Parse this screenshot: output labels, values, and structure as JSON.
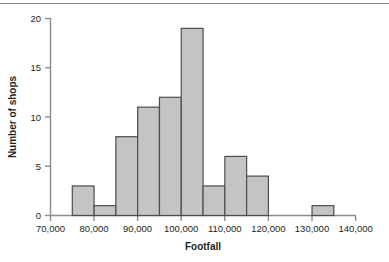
{
  "chart_data": {
    "type": "bar",
    "title": "",
    "subtitle": "",
    "xlabel": "Footfall",
    "ylabel": "Number of shops",
    "xlim": [
      70000,
      140000
    ],
    "ylim": [
      0,
      20
    ],
    "grid": false,
    "legend": null,
    "bin_width": 5000,
    "x_tick_labels": [
      "70,000",
      "80,000",
      "90,000",
      "100,000",
      "110,000",
      "120,000",
      "130,000",
      "140,000"
    ],
    "x_ticks": [
      70000,
      80000,
      90000,
      100000,
      110000,
      120000,
      130000,
      140000
    ],
    "y_tick_labels": [
      "0",
      "5",
      "10",
      "15",
      "20"
    ],
    "y_ticks": [
      0,
      5,
      10,
      15,
      20
    ],
    "categories": [
      "75,000-80,000",
      "80,000-85,000",
      "85,000-90,000",
      "90,000-95,000",
      "95,000-100,000",
      "100,000-105,000",
      "105,000-110,000",
      "110,000-115,000",
      "115,000-120,000",
      "120,000-125,000",
      "125,000-130,000",
      "130,000-135,000"
    ],
    "bin_starts": [
      75000,
      80000,
      85000,
      90000,
      95000,
      100000,
      105000,
      110000,
      115000,
      120000,
      125000,
      130000
    ],
    "values": [
      3,
      1,
      8,
      11,
      12,
      19,
      3,
      6,
      4,
      0,
      0,
      1
    ],
    "bar_fill": "#c4c4c4",
    "bar_stroke": "#4d4d4d",
    "axis_color": "#8c8c8c",
    "text_color": "#231f20"
  }
}
